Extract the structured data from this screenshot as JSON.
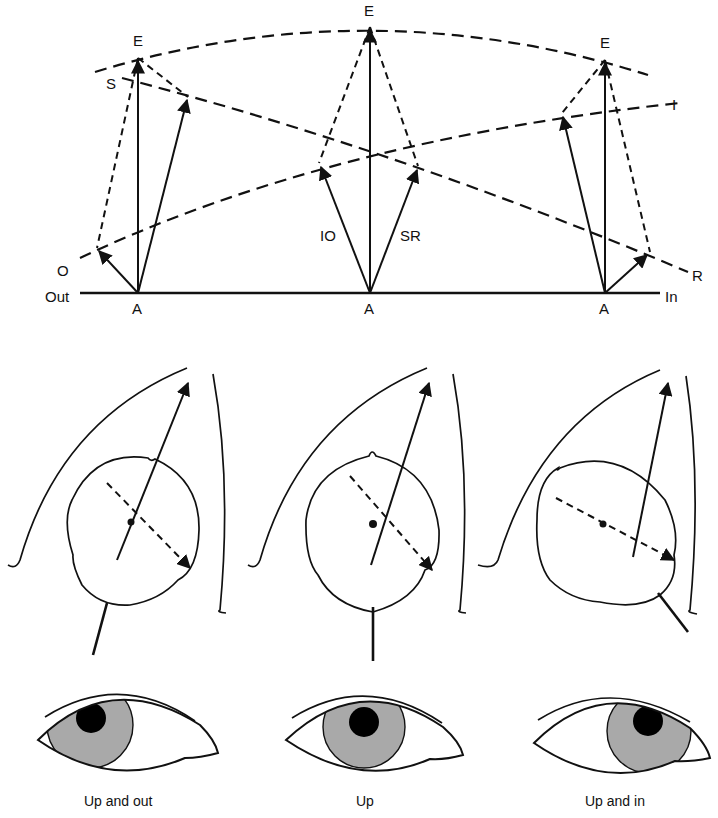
{
  "figure": {
    "vector_diagram": {
      "labels": {
        "E": "E",
        "A": "A",
        "S": "S",
        "O": "O",
        "I": "I",
        "R": "R",
        "IO": "IO",
        "SR": "SR",
        "out": "Out",
        "in": "In"
      }
    },
    "panels": [
      {
        "caption": "Up and out",
        "gaze": "up-and-out"
      },
      {
        "caption": "Up",
        "gaze": "up"
      },
      {
        "caption": "Up and in",
        "gaze": "up-and-in"
      }
    ],
    "colors": {
      "ink": "#111111",
      "iris": "#a9a9a9",
      "pupil": "#000000",
      "background": "#ffffff"
    }
  }
}
